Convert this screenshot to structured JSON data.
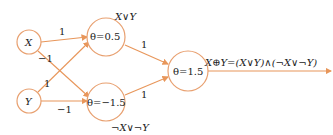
{
  "colors": {
    "edge": "#e8965a",
    "node_border": "#e8a070",
    "text": "#222222"
  },
  "nodes": {
    "x": {
      "label": "X"
    },
    "y": {
      "label": "Y"
    },
    "h1": {
      "label": "θ=0.5",
      "annotation": "X∨Y"
    },
    "h2": {
      "label": "θ=−1.5",
      "annotation": "¬X∨¬Y"
    },
    "out": {
      "label": "θ=1.5",
      "annotation": "X⊕Y=(X∨Y)∧(¬X∨¬Y)"
    }
  },
  "weights": {
    "x_h1": "1",
    "x_h2": "−1",
    "y_h1": "1",
    "y_h2": "−1",
    "h1_out": "1",
    "h2_out": "1"
  }
}
